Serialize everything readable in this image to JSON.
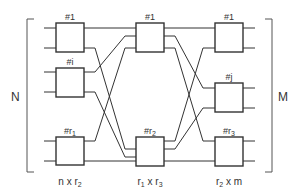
{
  "diagram": {
    "colors": {
      "stroke": "#333333",
      "text": "#333333",
      "background": "#ffffff"
    },
    "side_labels": {
      "left": "N",
      "right": "M"
    },
    "stages": [
      {
        "name": "ingress",
        "dimension": {
          "base": "n x r",
          "sub": "2"
        },
        "boxes": [
          {
            "label": "#1",
            "sub": ""
          },
          {
            "label": "#i",
            "sub": ""
          },
          {
            "label": "#r",
            "sub": "1"
          }
        ]
      },
      {
        "name": "middle",
        "dimension": {
          "a": "r",
          "a_sub": "1",
          "x": " x ",
          "b": "r",
          "b_sub": "3"
        },
        "boxes": [
          {
            "label": "#1",
            "sub": ""
          },
          {
            "label": "#r",
            "sub": "2"
          }
        ]
      },
      {
        "name": "egress",
        "dimension": {
          "base": "r",
          "sub": "2",
          "rest": " x m"
        },
        "boxes": [
          {
            "label": "#1",
            "sub": ""
          },
          {
            "label": "#j",
            "sub": ""
          },
          {
            "label": "#r",
            "sub": "3"
          }
        ]
      }
    ]
  }
}
